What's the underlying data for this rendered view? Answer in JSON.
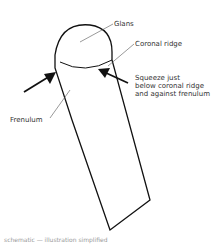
{
  "diagram": {
    "type": "labeled anatomical illustration (schematic placeholder)",
    "labels": {
      "glans": "Glans",
      "coronal_ridge": "Coronal ridge",
      "instruction": "Squeeze just\nbelow coronal ridge\nand against frenulum",
      "frenulum": "Frenulum"
    },
    "arrows": [
      {
        "from": "left",
        "points_to": "just below coronal ridge"
      },
      {
        "from": "right",
        "points_to": "just below coronal ridge"
      }
    ],
    "colors": {
      "line": "#111111",
      "text": "#333333",
      "background": "#ffffff"
    },
    "note": "schematic — illustration simplified"
  }
}
